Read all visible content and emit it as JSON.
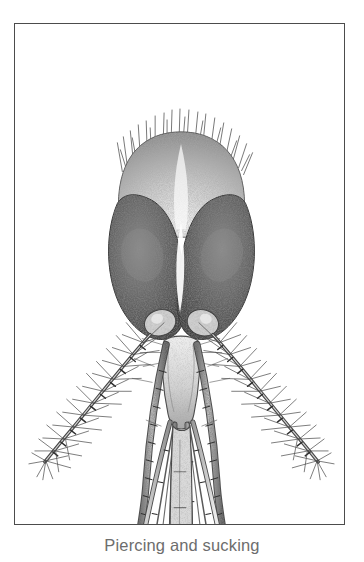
{
  "figure": {
    "caption": "Piercing and sucking",
    "frame": {
      "border_color": "#4c4c4c",
      "background_color": "#ffffff"
    },
    "illustration": {
      "subject": "mosquito head, frontal view",
      "style": "stipple engraving / pen-and-ink scientific illustration",
      "ink_color": "#3a3a3a",
      "eye_dark_color": "#4a4a4a",
      "eye_light_color": "#8c8c8c",
      "midtone_color": "#7a7a7a",
      "parts": [
        {
          "name": "vertex-setae",
          "label": "vertex bristles"
        },
        {
          "name": "compound-eye-left",
          "label": "left compound eye"
        },
        {
          "name": "compound-eye-right",
          "label": "right compound eye"
        },
        {
          "name": "antennal-torus-left",
          "label": "left antennal pedicel"
        },
        {
          "name": "antennal-torus-right",
          "label": "right antennal pedicel"
        },
        {
          "name": "clypeus",
          "label": "clypeus"
        },
        {
          "name": "antenna-left",
          "label": "left plumose antenna"
        },
        {
          "name": "antenna-right",
          "label": "right plumose antenna"
        },
        {
          "name": "maxillary-palp-left",
          "label": "left maxillary palp"
        },
        {
          "name": "maxillary-palp-right",
          "label": "right maxillary palp"
        },
        {
          "name": "labrum-epipharynx",
          "label": "labrum-epipharynx stylet"
        },
        {
          "name": "hypopharynx",
          "label": "hypopharynx stylet"
        },
        {
          "name": "mandible-left",
          "label": "left mandible stylet"
        },
        {
          "name": "mandible-right",
          "label": "right mandible stylet"
        },
        {
          "name": "maxilla-left",
          "label": "left maxilla stylet"
        },
        {
          "name": "maxilla-right",
          "label": "right maxilla stylet"
        },
        {
          "name": "labium",
          "label": "labium"
        },
        {
          "name": "labella",
          "label": "labella (paired terminal lobes)"
        }
      ]
    }
  }
}
